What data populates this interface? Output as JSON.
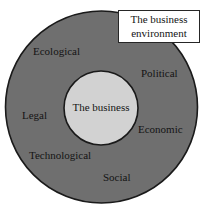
{
  "diagram": {
    "title_box": {
      "line1": "The business",
      "line2": "environment"
    },
    "core": {
      "label": "The business",
      "fill": "#d2d2d2",
      "stroke": "#1a1a1a"
    },
    "ring": {
      "fill": "#6f6f6f",
      "stroke": "#1a1a1a"
    },
    "factors": [
      {
        "label": "Ecological"
      },
      {
        "label": "Political"
      },
      {
        "label": "Legal"
      },
      {
        "label": "Economic"
      },
      {
        "label": "Technological"
      },
      {
        "label": "Social"
      }
    ],
    "background": "#ffffff"
  }
}
